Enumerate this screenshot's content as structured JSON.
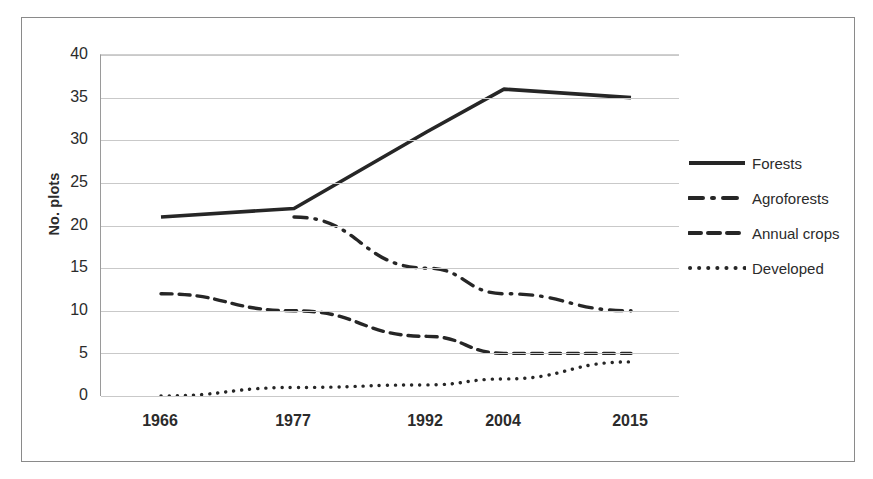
{
  "chart_data": {
    "type": "line",
    "title": "",
    "xlabel": "",
    "ylabel": "No. plots",
    "categories": [
      "1966",
      "1977",
      "1992",
      "2004",
      "2015"
    ],
    "x_tick_labels": [
      "1966",
      "1977",
      "1992",
      "2004",
      "2015"
    ],
    "y_tick_labels": [
      "0",
      "5",
      "10",
      "15",
      "20",
      "25",
      "30",
      "35",
      "40"
    ],
    "ylim": [
      0,
      40
    ],
    "ytick_step": 5,
    "grid": "horizontal",
    "legend_position": "right",
    "series": [
      {
        "name": "Forests",
        "style": "solid",
        "color": "#262626",
        "x": [
          "1966",
          "1977",
          "1992",
          "2004",
          "2015"
        ],
        "values": [
          21,
          22,
          31,
          36,
          35
        ]
      },
      {
        "name": "Agroforests",
        "style": "dash-dot",
        "color": "#262626",
        "x": [
          "1977",
          "1992",
          "2004",
          "2015"
        ],
        "values": [
          21,
          15,
          12,
          10
        ]
      },
      {
        "name": "Annual crops",
        "style": "dashed",
        "color": "#262626",
        "x": [
          "1966",
          "1977",
          "1992",
          "2004",
          "2015"
        ],
        "values": [
          12,
          10,
          7,
          5,
          5
        ]
      },
      {
        "name": "Developed",
        "style": "dotted",
        "color": "#262626",
        "x": [
          "1966",
          "1977",
          "1992",
          "2004",
          "2015"
        ],
        "values": [
          0,
          1,
          1.3,
          2,
          4
        ]
      }
    ]
  },
  "axis": {
    "y_title": "No. plots",
    "y_ticks": [
      "40",
      "35",
      "30",
      "25",
      "20",
      "15",
      "10",
      "5",
      "0"
    ],
    "x_ticks": [
      "1966",
      "1977",
      "1992",
      "2004",
      "2015"
    ]
  },
  "legend": {
    "items": [
      {
        "label": "Forests",
        "marker": "solid-line-icon"
      },
      {
        "label": "Agroforests",
        "marker": "dash-dot-line-icon"
      },
      {
        "label": "Annual crops",
        "marker": "dashed-line-icon"
      },
      {
        "label": "Developed",
        "marker": "dotted-line-icon"
      }
    ]
  },
  "colors": {
    "line": "#262626",
    "grid": "#c9c9c9",
    "frame": "#8a8a8a",
    "text": "#2b2b2b",
    "background": "#ffffff"
  }
}
